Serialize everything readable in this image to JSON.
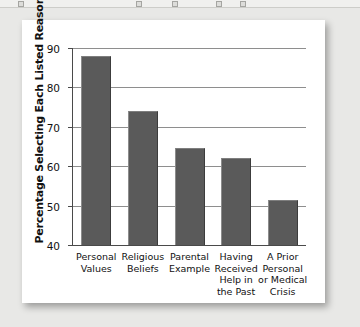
{
  "chart_data": {
    "type": "bar",
    "title": "",
    "xlabel": "",
    "ylabel": "Percentage Selecting Each Listed Reason",
    "ylim": [
      40,
      90
    ],
    "yticks": [
      40,
      50,
      60,
      70,
      80,
      90
    ],
    "ytick_labels": [
      "40",
      "50",
      "60",
      "70",
      "80",
      "90"
    ],
    "grid": true,
    "legend": null,
    "bar_color": "#5a5a5a",
    "categories": [
      "Personal Values",
      "Religious Beliefs",
      "Parental Example",
      "Having Received Help in the Past",
      "A Prior Personal or Medical Crisis"
    ],
    "category_lines": [
      [
        "Personal",
        "Values"
      ],
      [
        "Religious",
        "Beliefs"
      ],
      [
        "Parental",
        "Example"
      ],
      [
        "Having",
        "Received",
        "Help in",
        "the Past"
      ],
      [
        "A Prior",
        "Personal",
        "or Medical",
        "Crisis"
      ]
    ],
    "values": [
      88,
      74,
      64.5,
      62,
      51.5
    ]
  },
  "figure": {
    "background": "#e8e8e6",
    "card_background": "#ffffff"
  }
}
